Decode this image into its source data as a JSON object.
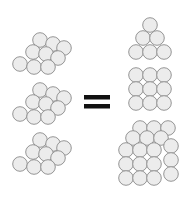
{
  "diagram": {
    "colors": {
      "sphere_fill": "#ececec",
      "sphere_stroke": "#8a8a8a",
      "equals_sign": "#111111",
      "background": "#ffffff"
    },
    "sphere_radius": 7.3,
    "left_clusters": [
      {
        "name": "oblique-cluster-1",
        "spheres": [
          [
            40,
            40
          ],
          [
            53,
            44
          ],
          [
            64,
            48
          ],
          [
            33,
            52
          ],
          [
            46,
            54
          ],
          [
            58,
            58
          ],
          [
            20,
            64
          ],
          [
            34,
            67
          ],
          [
            48,
            67
          ]
        ]
      },
      {
        "name": "oblique-cluster-2",
        "spheres": [
          [
            40,
            90
          ],
          [
            53,
            94
          ],
          [
            64,
            98
          ],
          [
            33,
            102
          ],
          [
            46,
            104
          ],
          [
            58,
            108
          ],
          [
            20,
            114
          ],
          [
            34,
            117
          ],
          [
            48,
            117
          ]
        ]
      },
      {
        "name": "oblique-cluster-3",
        "spheres": [
          [
            40,
            140
          ],
          [
            53,
            144
          ],
          [
            64,
            148
          ],
          [
            33,
            152
          ],
          [
            46,
            154
          ],
          [
            58,
            158
          ],
          [
            20,
            164
          ],
          [
            34,
            167
          ],
          [
            48,
            167
          ]
        ]
      }
    ],
    "equals": {
      "bars": [
        {
          "x": 84,
          "y": 95,
          "w": 26,
          "h": 4.5
        },
        {
          "x": 84,
          "y": 104,
          "w": 26,
          "h": 4.5
        }
      ]
    },
    "right_shapes": [
      {
        "name": "triangle-stack",
        "spheres": [
          [
            150,
            25
          ],
          [
            143,
            38
          ],
          [
            157,
            38
          ],
          [
            136,
            52
          ],
          [
            150,
            52
          ],
          [
            164,
            52
          ]
        ]
      },
      {
        "name": "square-grid",
        "spheres": [
          [
            136,
            75
          ],
          [
            150,
            75
          ],
          [
            164,
            75
          ],
          [
            136,
            89
          ],
          [
            150,
            89
          ],
          [
            164,
            89
          ],
          [
            136,
            103
          ],
          [
            150,
            103
          ],
          [
            164,
            103
          ]
        ]
      },
      {
        "name": "cubic-stack",
        "back_spheres": [
          [
            140,
            128
          ],
          [
            154,
            128
          ],
          [
            168,
            128
          ],
          [
            133,
            138
          ],
          [
            147,
            138
          ],
          [
            161,
            138
          ],
          [
            171,
            146
          ],
          [
            171,
            160
          ],
          [
            171,
            174
          ]
        ],
        "front_spheres": [
          [
            126,
            150
          ],
          [
            140,
            150
          ],
          [
            154,
            150
          ],
          [
            126,
            164
          ],
          [
            140,
            164
          ],
          [
            154,
            164
          ],
          [
            126,
            178
          ],
          [
            140,
            178
          ],
          [
            154,
            178
          ]
        ]
      }
    ]
  }
}
